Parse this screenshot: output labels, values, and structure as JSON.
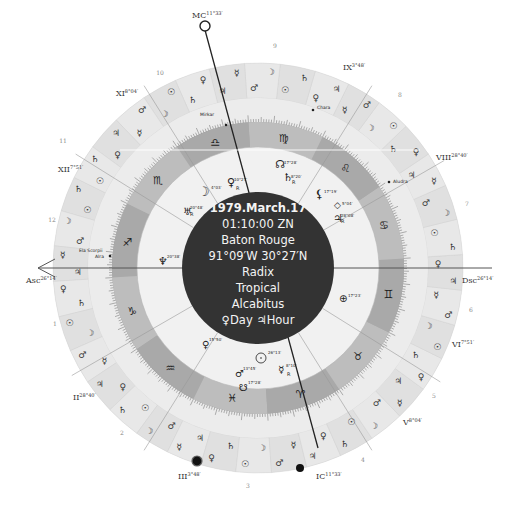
{
  "chart": {
    "center_info": {
      "date": "1979.March.17",
      "time": "01:10:00 ZN",
      "place": "Baton Rouge",
      "coords": "91°09′W 30°27′N",
      "chart_type": "Radix",
      "zodiac": "Tropical",
      "house_system": "Alcabitus",
      "day_hour": "♀Day ♃Hour"
    },
    "angles": [
      {
        "name": "MC",
        "label": "MC",
        "degree": "11°33′"
      },
      {
        "name": "IC",
        "label": "IC",
        "degree": "11°33′"
      },
      {
        "name": "Asc",
        "label": "Asc",
        "degree": "26°14′"
      },
      {
        "name": "Dsc",
        "label": "Dsc",
        "degree": "26°14′"
      }
    ],
    "house_cusps": [
      {
        "label": "XI",
        "degree": "8°04′"
      },
      {
        "label": "XII",
        "degree": "7°51′"
      },
      {
        "label": "II",
        "degree": "28°40′"
      },
      {
        "label": "III",
        "degree": "3°48′"
      },
      {
        "label": "V",
        "degree": "8°04′"
      },
      {
        "label": "VI",
        "degree": "7°51′"
      },
      {
        "label": "VIII",
        "degree": "28°40′"
      },
      {
        "label": "IX",
        "degree": "3°48′"
      }
    ],
    "house_numbers": [
      "1",
      "2",
      "3",
      "4",
      "5",
      "6",
      "7",
      "8",
      "9",
      "10",
      "11",
      "12"
    ],
    "signs": [
      "♈",
      "♉",
      "♊",
      "♋",
      "♌",
      "♍",
      "♎",
      "♏",
      "♐",
      "♑",
      "♒",
      "♓"
    ],
    "fixed_stars": [
      "Mirkar",
      "Chara",
      "Aludra",
      "Ela Scorpii",
      "Alra"
    ],
    "planets": [
      {
        "glyph": "☽",
        "degree": "4°03′",
        "retro": ""
      },
      {
        "glyph": "♀",
        "degree": "10°27′",
        "retro": "R"
      },
      {
        "glyph": "♅",
        "degree": "20°48′",
        "retro": "R"
      },
      {
        "glyph": "☊",
        "degree": "17°28′",
        "retro": ""
      },
      {
        "glyph": "♄",
        "degree": "8°20′",
        "retro": "R"
      },
      {
        "glyph": "⚸",
        "degree": "17°19′",
        "retro": ""
      },
      {
        "glyph": "◇",
        "degree": "5°04′",
        "retro": ""
      },
      {
        "glyph": "♃",
        "degree": "28°08′",
        "retro": "R"
      },
      {
        "glyph": "♆",
        "degree": "20°38′",
        "retro": ""
      },
      {
        "glyph": "⊕",
        "degree": "17°23′",
        "retro": ""
      },
      {
        "glyph": "☉",
        "degree": "26°13′",
        "retro": ""
      },
      {
        "glyph": "☿",
        "degree": "8°10′",
        "retro": "R"
      },
      {
        "glyph": "♂",
        "degree": "13°45′",
        "retro": ""
      },
      {
        "glyph": "☋",
        "degree": "17°28′",
        "retro": ""
      },
      {
        "glyph": "♀",
        "degree": "15°50′",
        "retro": ""
      }
    ],
    "colors": {
      "outer_ring": "#e2e2e2",
      "outer_ring_alt": "#d2d2d2",
      "middle_ring": "#ececec",
      "sign_band": "#a8a8a8",
      "sign_band_alt": "#bdbdbd",
      "inner_field": "#f1f1f1",
      "center_disk": "#333333",
      "center_text": "#f4f4f4",
      "line": "#555555"
    }
  }
}
